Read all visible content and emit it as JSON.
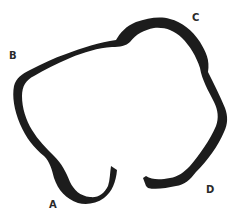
{
  "diagram": {
    "shape": "open loop band (stomach-like outline)",
    "stroke_color": "#1c1c1c",
    "background": "#ffffff",
    "labels": [
      {
        "id": "A",
        "text": "A",
        "x": 49,
        "y": 200
      },
      {
        "id": "B",
        "text": "B",
        "x": 9,
        "y": 51
      },
      {
        "id": "C",
        "text": "C",
        "x": 192,
        "y": 13
      },
      {
        "id": "D",
        "text": "D",
        "x": 206,
        "y": 185
      }
    ]
  }
}
